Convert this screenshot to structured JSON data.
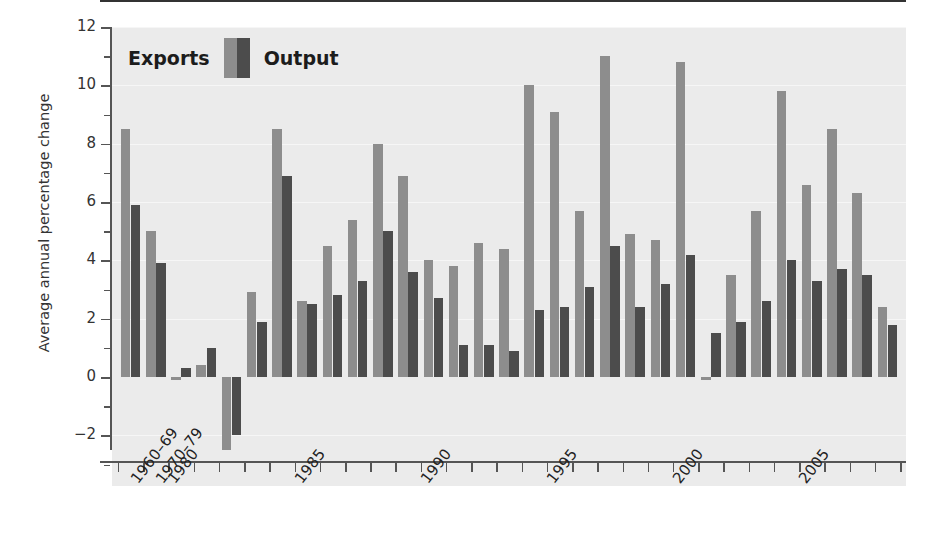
{
  "chart_data": {
    "type": "bar",
    "title": "",
    "xlabel": "",
    "ylabel": "Average annual percentage change",
    "ylim": [
      -3,
      12
    ],
    "yticks": [
      -2,
      0,
      2,
      4,
      6,
      8,
      10,
      12
    ],
    "ytick_labels": [
      "−2",
      "0",
      "2",
      "4",
      "6",
      "8",
      "10",
      "12"
    ],
    "grid": true,
    "legend_position": "top-left",
    "legend": [
      "Exports",
      "Output"
    ],
    "categories": [
      "1960–69",
      "1970–79",
      "1980",
      "1981",
      "1982",
      "1983",
      "1984",
      "1985",
      "1986",
      "1987",
      "1988",
      "1989",
      "1990",
      "1991",
      "1992",
      "1993",
      "1994",
      "1995",
      "1996",
      "1997",
      "1998",
      "1999",
      "2000",
      "2001",
      "2002",
      "2003",
      "2004",
      "2005",
      "2006",
      "2007",
      "2008"
    ],
    "xtick_labels": [
      "1960–69",
      "1970–79",
      "1980",
      "1985",
      "1990",
      "1995",
      "2000",
      "2005"
    ],
    "series": [
      {
        "name": "Exports",
        "color": "#8d8d8d",
        "values": [
          8.5,
          5.0,
          -0.1,
          0.4,
          -2.5,
          2.9,
          8.5,
          2.6,
          4.5,
          5.4,
          8.0,
          6.9,
          4.0,
          3.8,
          4.6,
          4.4,
          10.0,
          9.1,
          5.7,
          11.0,
          4.9,
          4.7,
          10.8,
          -0.1,
          3.5,
          5.7,
          9.8,
          6.6,
          8.5,
          6.3,
          2.4
        ]
      },
      {
        "name": "Output",
        "color": "#4c4c4c",
        "values": [
          5.9,
          3.9,
          0.3,
          1.0,
          -2.0,
          1.9,
          6.9,
          2.5,
          2.8,
          3.3,
          5.0,
          3.6,
          2.7,
          1.1,
          1.1,
          0.9,
          2.3,
          2.4,
          3.1,
          4.5,
          2.4,
          3.2,
          4.2,
          1.5,
          1.9,
          2.6,
          4.0,
          3.3,
          3.7,
          3.5,
          1.8
        ]
      }
    ]
  },
  "axis": {
    "y_title": "Average annual percentage change"
  },
  "colors": {
    "exports": "#8d8d8d",
    "output": "#4c4c4c",
    "plot_background": "#ebebeb",
    "axis": "#555555"
  }
}
